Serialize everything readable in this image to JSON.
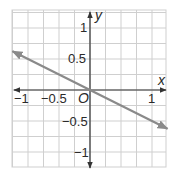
{
  "chart_data": {
    "type": "line",
    "title": "",
    "xlabel": "x",
    "ylabel": "y",
    "origin_label": "O",
    "xlim": [
      -1.25,
      1.25
    ],
    "ylim": [
      -1.25,
      1.25
    ],
    "grid": true,
    "grid_step": 0.25,
    "x_ticks": [
      {
        "value": -1,
        "label": "−1"
      },
      {
        "value": -0.5,
        "label": "−0.5"
      },
      {
        "value": 1,
        "label": "1"
      }
    ],
    "y_ticks": [
      {
        "value": 1,
        "label": "1"
      },
      {
        "value": 0.5,
        "label": "0.5"
      },
      {
        "value": -0.5,
        "label": "−0.5"
      },
      {
        "value": -1,
        "label": "−1"
      }
    ],
    "series": [
      {
        "name": "y = -0.5x",
        "equation": "y = -0.5x",
        "color": "#8a8a8a",
        "arrows": "both",
        "x": [
          -1.25,
          1.25
        ],
        "y": [
          0.625,
          -0.625
        ]
      }
    ],
    "colors": {
      "grid": "#c8c8c8",
      "axis": "#333333",
      "line": "#8a8a8a"
    }
  }
}
